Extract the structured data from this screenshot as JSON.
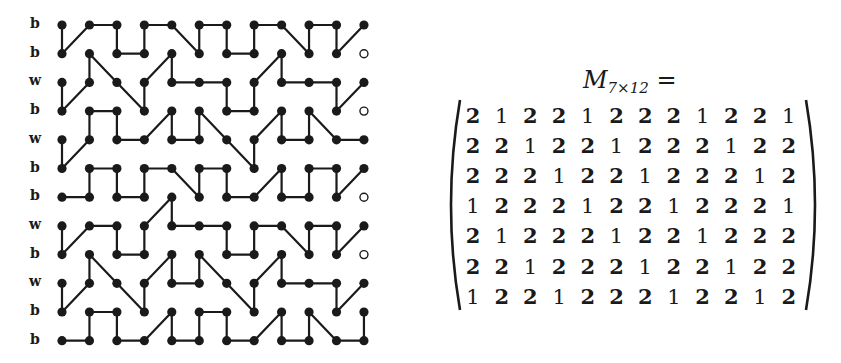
{
  "figure": {
    "grid": {
      "columns": 12,
      "rows": 12,
      "origin_x": 62,
      "origin_y": 25,
      "col_spacing": 27.45,
      "row_spacing": 28.7,
      "node_radius": 4.6,
      "row_labels": [
        "b",
        "b",
        "w",
        "b",
        "w",
        "b",
        "b",
        "w",
        "b",
        "w",
        "b",
        "b"
      ],
      "open_nodes": [
        [
          11,
          1
        ],
        [
          11,
          3
        ],
        [
          11,
          6
        ],
        [
          11,
          8
        ]
      ],
      "paths": [
        [
          [
            0,
            0
          ],
          [
            0,
            1
          ],
          [
            1,
            0
          ],
          [
            2,
            0
          ],
          [
            2,
            1
          ],
          [
            3,
            1
          ],
          [
            3,
            0
          ],
          [
            4,
            0
          ],
          [
            5,
            1
          ],
          [
            5,
            0
          ],
          [
            6,
            0
          ],
          [
            6,
            1
          ],
          [
            7,
            1
          ],
          [
            7,
            0
          ],
          [
            8,
            0
          ],
          [
            9,
            1
          ],
          [
            9,
            0
          ],
          [
            10,
            0
          ],
          [
            10,
            1
          ],
          [
            11,
            0
          ]
        ],
        [
          [
            0,
            2
          ],
          [
            0,
            3
          ],
          [
            1,
            2
          ],
          [
            1,
            1
          ],
          [
            2,
            2
          ],
          [
            3,
            3
          ],
          [
            3,
            2
          ],
          [
            4,
            1
          ],
          [
            4,
            2
          ],
          [
            5,
            2
          ],
          [
            6,
            2
          ],
          [
            6,
            3
          ],
          [
            7,
            3
          ],
          [
            7,
            2
          ],
          [
            8,
            1
          ],
          [
            8,
            2
          ],
          [
            9,
            2
          ],
          [
            10,
            2
          ],
          [
            10,
            3
          ],
          [
            11,
            2
          ]
        ],
        [
          [
            0,
            4
          ],
          [
            0,
            5
          ],
          [
            1,
            4
          ],
          [
            1,
            3
          ],
          [
            2,
            3
          ],
          [
            2,
            4
          ],
          [
            3,
            4
          ],
          [
            4,
            3
          ],
          [
            4,
            4
          ],
          [
            5,
            4
          ],
          [
            5,
            3
          ],
          [
            6,
            4
          ],
          [
            7,
            5
          ],
          [
            7,
            4
          ],
          [
            8,
            3
          ],
          [
            8,
            4
          ],
          [
            9,
            4
          ],
          [
            9,
            3
          ],
          [
            10,
            4
          ],
          [
            11,
            4
          ]
        ],
        [
          [
            0,
            6
          ],
          [
            1,
            6
          ],
          [
            1,
            5
          ],
          [
            2,
            5
          ],
          [
            2,
            6
          ],
          [
            3,
            6
          ],
          [
            3,
            5
          ],
          [
            4,
            5
          ],
          [
            5,
            6
          ],
          [
            5,
            5
          ],
          [
            6,
            5
          ],
          [
            6,
            6
          ],
          [
            7,
            6
          ],
          [
            8,
            5
          ],
          [
            8,
            6
          ],
          [
            9,
            6
          ],
          [
            9,
            5
          ],
          [
            10,
            5
          ],
          [
            10,
            6
          ],
          [
            11,
            5
          ]
        ],
        [
          [
            0,
            7
          ],
          [
            0,
            8
          ],
          [
            1,
            7
          ],
          [
            2,
            7
          ],
          [
            2,
            8
          ],
          [
            3,
            8
          ],
          [
            3,
            7
          ],
          [
            4,
            6
          ],
          [
            4,
            7
          ],
          [
            5,
            7
          ],
          [
            6,
            7
          ],
          [
            6,
            8
          ],
          [
            7,
            8
          ],
          [
            7,
            7
          ],
          [
            8,
            7
          ],
          [
            9,
            8
          ],
          [
            9,
            7
          ],
          [
            10,
            7
          ],
          [
            10,
            8
          ],
          [
            11,
            7
          ]
        ],
        [
          [
            0,
            9
          ],
          [
            0,
            10
          ],
          [
            1,
            9
          ],
          [
            1,
            8
          ],
          [
            2,
            9
          ],
          [
            3,
            10
          ],
          [
            3,
            9
          ],
          [
            4,
            8
          ],
          [
            4,
            9
          ],
          [
            5,
            9
          ],
          [
            5,
            8
          ],
          [
            6,
            9
          ],
          [
            7,
            10
          ],
          [
            7,
            9
          ],
          [
            8,
            8
          ],
          [
            8,
            9
          ],
          [
            9,
            9
          ],
          [
            10,
            9
          ],
          [
            10,
            10
          ],
          [
            11,
            9
          ]
        ],
        [
          [
            0,
            11
          ],
          [
            1,
            11
          ],
          [
            1,
            10
          ],
          [
            2,
            10
          ],
          [
            2,
            11
          ],
          [
            3,
            11
          ],
          [
            4,
            10
          ],
          [
            4,
            11
          ],
          [
            5,
            11
          ],
          [
            5,
            10
          ],
          [
            6,
            10
          ],
          [
            6,
            11
          ],
          [
            7,
            11
          ],
          [
            8,
            10
          ],
          [
            8,
            11
          ],
          [
            9,
            11
          ],
          [
            9,
            10
          ],
          [
            10,
            11
          ],
          [
            11,
            11
          ],
          [
            11,
            10
          ]
        ]
      ],
      "colors": {
        "ink": "#1a1a1a",
        "background": "#ffffff"
      }
    },
    "matrix": {
      "name": "M",
      "subscript": "7×12",
      "equals": "=",
      "values": [
        [
          2,
          1,
          2,
          2,
          1,
          2,
          2,
          2,
          1,
          2,
          2,
          1
        ],
        [
          2,
          2,
          1,
          2,
          2,
          1,
          2,
          2,
          2,
          1,
          2,
          2
        ],
        [
          2,
          2,
          2,
          1,
          2,
          2,
          1,
          2,
          2,
          2,
          1,
          2
        ],
        [
          1,
          2,
          2,
          2,
          1,
          2,
          2,
          1,
          2,
          2,
          2,
          1
        ],
        [
          2,
          1,
          2,
          2,
          2,
          1,
          2,
          2,
          1,
          2,
          2,
          2
        ],
        [
          2,
          2,
          1,
          2,
          2,
          2,
          1,
          2,
          2,
          1,
          2,
          2
        ],
        [
          1,
          2,
          2,
          1,
          2,
          2,
          2,
          1,
          2,
          2,
          1,
          2
        ]
      ]
    }
  }
}
